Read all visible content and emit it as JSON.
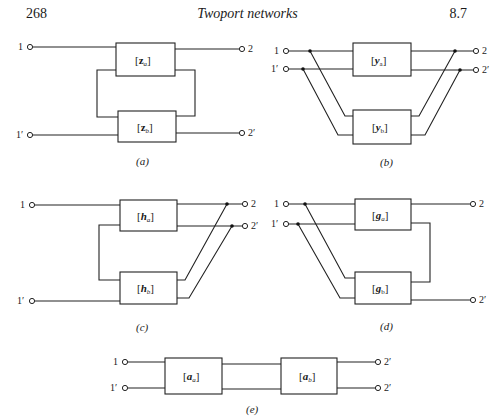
{
  "header": {
    "page_number": "268",
    "running_title": "Twoport networks",
    "section": "8.7"
  },
  "figures": {
    "a": {
      "caption": "(a)",
      "connection": "series-series",
      "matrix_top": "[z_a]",
      "matrix_top_sym": "z",
      "matrix_top_sub": "a",
      "matrix_bottom_sym": "z",
      "matrix_bottom_sub": "b",
      "terminals": {
        "in1": "1",
        "in2": "1′",
        "out1": "2",
        "out2": "2′"
      }
    },
    "b": {
      "caption": "(b)",
      "connection": "parallel-parallel",
      "matrix_top_sym": "y",
      "matrix_top_sub": "a",
      "matrix_bottom_sym": "y",
      "matrix_bottom_sub": "b",
      "terminals": {
        "in1": "1",
        "in2": "1′",
        "out1": "2",
        "out2": "2′"
      }
    },
    "c": {
      "caption": "(c)",
      "connection": "series-parallel",
      "matrix_top_sym": "h",
      "matrix_top_sub": "a",
      "matrix_bottom_sym": "h",
      "matrix_bottom_sub": "b",
      "terminals": {
        "in1": "1",
        "in2": "1′",
        "out1": "2",
        "out2": "2′"
      }
    },
    "d": {
      "caption": "(d)",
      "connection": "parallel-series",
      "matrix_top_sym": "g",
      "matrix_top_sub": "a",
      "matrix_bottom_sym": "g",
      "matrix_bottom_sub": "b",
      "terminals": {
        "in1": "1",
        "in2": "1′",
        "out1": "2",
        "out2": "2′"
      }
    },
    "e": {
      "caption": "(e)",
      "connection": "cascade",
      "matrix_left_sym": "a",
      "matrix_left_sub": "a",
      "matrix_right_sym": "a",
      "matrix_right_sub": "b",
      "terminals": {
        "in1": "1",
        "in2": "1′",
        "out1": "2′",
        "out2": "2′"
      }
    }
  },
  "bracket_open": "[",
  "bracket_close": "]"
}
